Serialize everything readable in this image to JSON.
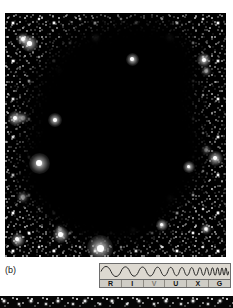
{
  "figure": {
    "panel_label": "(b)",
    "background_color": "#ffffff",
    "sky_color": "#000000"
  },
  "spectrum_indicator": {
    "name": "electromagnetic-spectrum-band-indicator",
    "wave_description": "sine wave with frequency increasing left to right",
    "active_band": "V",
    "bands": [
      {
        "code": "R",
        "name": "Radio"
      },
      {
        "code": "I",
        "name": "Infrared"
      },
      {
        "code": "V",
        "name": "Visible"
      },
      {
        "code": "U",
        "name": "Ultraviolet"
      },
      {
        "code": "X",
        "name": "X-ray"
      },
      {
        "code": "G",
        "name": "Gamma ray"
      }
    ],
    "colors": {
      "panel": "#cfcdc6",
      "wave_panel": "#ddd9d1",
      "border": "#6e6e6e",
      "label": "#111111",
      "active_label": "#7d7a72"
    }
  },
  "next_panel_strip": {
    "name": "next-figure-top-edge",
    "sky_color": "#060606"
  }
}
